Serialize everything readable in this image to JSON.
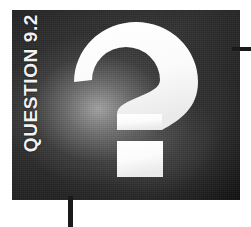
{
  "figure": {
    "caption": "QUESTION 9.2",
    "symbol": "question-mark",
    "symbol_char": "?",
    "panel_color": "#1b1b1b",
    "symbol_color": "#ffffff",
    "caption_color": "#f2f2f2",
    "rule_color": "#1a1a1a"
  },
  "annotations": {
    "horizontal_rule": "",
    "vertical_rule": ""
  }
}
